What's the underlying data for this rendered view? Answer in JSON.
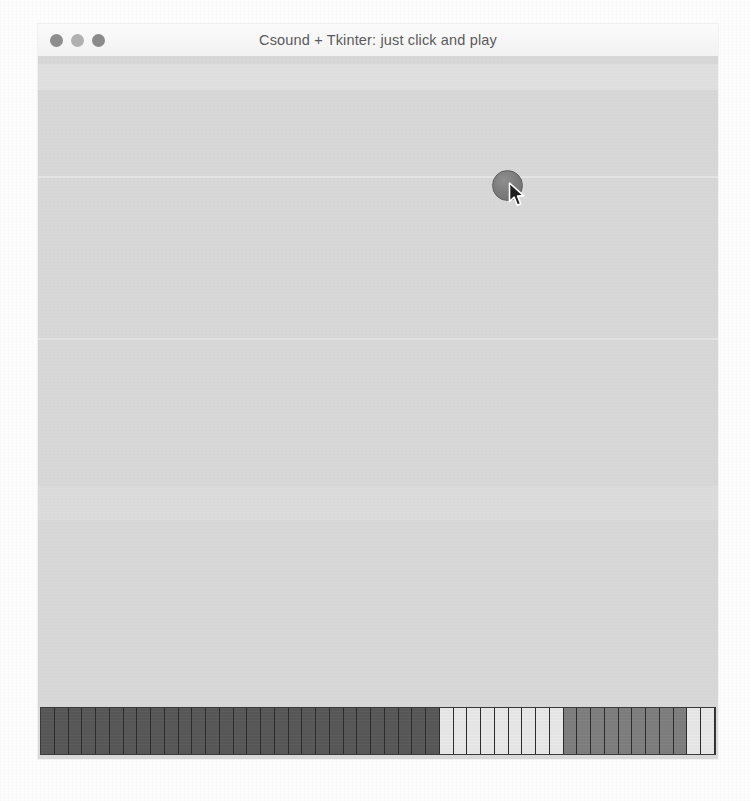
{
  "window": {
    "title": "Csound + Tkinter: just click and play",
    "traffic_lights": [
      {
        "name": "close-button",
        "label": "Close",
        "color": "#8d8d8d"
      },
      {
        "name": "minimize-button",
        "label": "Minimize",
        "color": "#b0b0b0"
      },
      {
        "name": "zoom-button",
        "label": "Zoom",
        "color": "#8a8a8a"
      }
    ],
    "background_color": "#d8d8d8",
    "titlebar_color": "#f6f6f6"
  },
  "canvas": {
    "label": "Click and play canvas",
    "note_blob": {
      "label": "note-blob",
      "color": "#7c7c7c",
      "x": 454,
      "y": 114,
      "diameter": 31
    },
    "cursor": {
      "label": "mouse-pointer",
      "x": 470,
      "y": 126
    }
  },
  "keyboard_strip": {
    "label": "Keyboard strip",
    "cell_count": 48,
    "colors": {
      "dark": "#585858",
      "medium": "#7e7e7e",
      "light": "#e8e8e8",
      "divider": "#2b2b2b"
    },
    "cells": [
      "dark",
      "dark",
      "dark",
      "dark",
      "dark",
      "dark",
      "dark",
      "dark",
      "dark",
      "dark",
      "dark",
      "dark",
      "dark",
      "dark",
      "dark",
      "dark",
      "dark",
      "dark",
      "dark",
      "dark",
      "dark",
      "dark",
      "dark",
      "dark",
      "dark",
      "dark",
      "dark",
      "dark",
      "dark",
      "light",
      "light",
      "light",
      "light",
      "light",
      "light",
      "light",
      "light",
      "light",
      "medium",
      "medium",
      "medium",
      "medium",
      "medium",
      "medium",
      "medium",
      "medium",
      "medium",
      "light",
      "light"
    ]
  }
}
